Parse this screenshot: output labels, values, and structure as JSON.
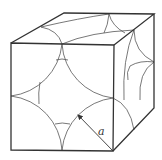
{
  "diagram": {
    "colors": {
      "edge": "#333333",
      "arc": "#555555",
      "background": "#ffffff"
    },
    "cube": {
      "front_face": {
        "tl": [
          11,
          43
        ],
        "tr": [
          114,
          45
        ],
        "br": [
          113,
          151
        ],
        "bl": [
          11,
          150
        ]
      },
      "back_corners": {
        "tl": [
          64,
          13
        ],
        "tr": [
          154,
          14
        ],
        "br": [
          154,
          108
        ]
      }
    },
    "dimension": {
      "label": "a",
      "arrow_from": [
        113,
        151
      ],
      "arrow_to": [
        77,
        114
      ],
      "label_position": [
        98,
        132
      ]
    }
  }
}
